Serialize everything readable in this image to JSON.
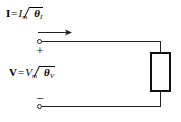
{
  "figure": {
    "type": "circuit-diagram",
    "width": 181,
    "height": 122,
    "background_color": "#ffffff",
    "line_color": "#222222"
  },
  "labels": {
    "current": {
      "vector": "I",
      "equals": "=",
      "magnitude": "I",
      "magnitude_subscript": "m",
      "angle_symbol": "∠",
      "angle_variable": "θ",
      "angle_subscript": "I",
      "full_text": "I = I_m ∠θ_I"
    },
    "voltage": {
      "vector": "V",
      "equals": "=",
      "magnitude": "V",
      "magnitude_subscript": "m",
      "angle_symbol": "∠",
      "angle_variable": "θ",
      "angle_subscript": "V",
      "full_text": "V = V_m ∠θ_V"
    }
  },
  "polarity": {
    "positive": "+",
    "negative": "−"
  },
  "elements": {
    "current_arrow": {
      "name": "current-direction-arrow",
      "direction": "right"
    },
    "terminal_top": {
      "name": "top-terminal",
      "style": "open-circle"
    },
    "terminal_bottom": {
      "name": "bottom-terminal",
      "style": "open-circle"
    },
    "impedance_box": {
      "name": "impedance-element",
      "style": "rectangle",
      "label": ""
    }
  }
}
